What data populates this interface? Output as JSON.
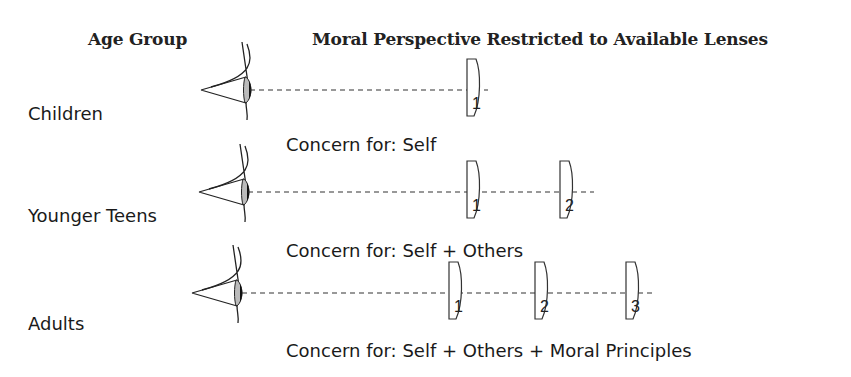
{
  "headers": {
    "age_group": "Age Group",
    "perspective": "Moral Perspective Restricted to Available Lenses"
  },
  "rows": [
    {
      "age_group": "Children",
      "lenses": [
        "1"
      ],
      "concern": "Concern for: Self"
    },
    {
      "age_group": "Younger Teens",
      "lenses": [
        "1",
        "2"
      ],
      "concern": "Concern for: Self + Others"
    },
    {
      "age_group": "Adults",
      "lenses": [
        "1",
        "2",
        "3"
      ],
      "concern": "Concern for: Self + Others + Moral Principles"
    }
  ],
  "icons": {
    "eye": "eye-icon",
    "lens": "lens-icon"
  },
  "colors": {
    "text": "#1a1a1a",
    "line": "#333333",
    "background": "#ffffff"
  }
}
